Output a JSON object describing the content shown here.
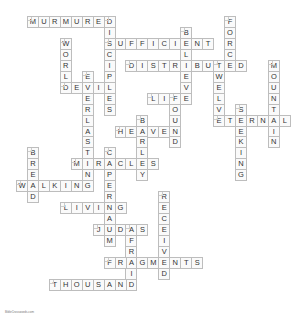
{
  "puzzle": {
    "type": "crossword",
    "words": [
      {
        "answer": "MURMURED",
        "dir": "across",
        "row": 0,
        "col": 2
      },
      {
        "answer": "FORCE",
        "dir": "down",
        "row": 0,
        "col": 20
      },
      {
        "answer": "DISCIPLES",
        "dir": "down",
        "row": 0,
        "col": 9
      },
      {
        "answer": "BELIEVE",
        "dir": "down",
        "row": 1,
        "col": 16
      },
      {
        "answer": "SUFFICIENT",
        "dir": "across",
        "row": 2,
        "col": 9
      },
      {
        "answer": "WORLD",
        "dir": "down",
        "row": 2,
        "col": 5
      },
      {
        "answer": "DISTRIBUTED",
        "dir": "across",
        "row": 4,
        "col": 11
      },
      {
        "answer": "TWELVE",
        "dir": "down",
        "row": 4,
        "col": 19
      },
      {
        "answer": "MOUNTAIN",
        "dir": "down",
        "row": 4,
        "col": 24
      },
      {
        "answer": "EVERLASTING",
        "dir": "down",
        "row": 5,
        "col": 7
      },
      {
        "answer": "DEVIL",
        "dir": "across",
        "row": 6,
        "col": 5
      },
      {
        "answer": "LIFE",
        "dir": "across",
        "row": 7,
        "col": 13
      },
      {
        "answer": "FOUND",
        "dir": "down",
        "row": 7,
        "col": 15
      },
      {
        "answer": "SEEKING",
        "dir": "down",
        "row": 8,
        "col": 21
      },
      {
        "answer": "BARLEY",
        "dir": "down",
        "row": 9,
        "col": 12
      },
      {
        "answer": "ETERNAL",
        "dir": "across",
        "row": 9,
        "col": 19
      },
      {
        "answer": "HEAVEN",
        "dir": "across",
        "row": 10,
        "col": 10
      },
      {
        "answer": "BREAD",
        "dir": "down",
        "row": 12,
        "col": 2
      },
      {
        "answer": "CAPERNAUM",
        "dir": "down",
        "row": 12,
        "col": 9
      },
      {
        "answer": "MIRACLES",
        "dir": "across",
        "row": 13,
        "col": 6
      },
      {
        "answer": "WALKING",
        "dir": "across",
        "row": 15,
        "col": 1
      },
      {
        "answer": "RECEIVED",
        "dir": "down",
        "row": 16,
        "col": 14
      },
      {
        "answer": "LIVING",
        "dir": "across",
        "row": 17,
        "col": 5
      },
      {
        "answer": "JUDAS",
        "dir": "across",
        "row": 19,
        "col": 8
      },
      {
        "answer": "AFRAID",
        "dir": "down",
        "row": 19,
        "col": 11
      },
      {
        "answer": "FRAGMENTS",
        "dir": "across",
        "row": 22,
        "col": 9
      },
      {
        "answer": "THOUSAND",
        "dir": "across",
        "row": 24,
        "col": 4
      }
    ]
  },
  "footer": {
    "text": "BibleCrosswords.com"
  }
}
